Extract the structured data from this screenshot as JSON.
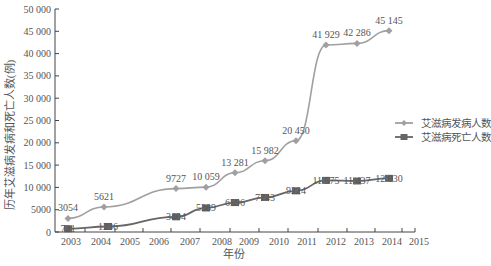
{
  "chart_data": {
    "type": "line",
    "title": "",
    "xlabel": "年份",
    "ylabel": "历年艾滋病发病和死亡人数(例)",
    "ylim": [
      0,
      50000
    ],
    "y_ticks": [
      "0",
      "5000",
      "10 000",
      "15 000",
      "20 000",
      "25 000",
      "30 000",
      "35 000",
      "40 000",
      "45 000",
      "50 000"
    ],
    "x_ticks": [
      "2003",
      "2004",
      "2005",
      "2006",
      "2007",
      "2008",
      "2009",
      "2010",
      "2011",
      "2012",
      "2013",
      "2014",
      "2015"
    ],
    "legend_position": "right",
    "grid": false,
    "series": [
      {
        "name": "艾滋病发病人数",
        "marker": "diamond",
        "color": "#a0a0a0",
        "x_px": [
          68,
          104,
          176,
          206,
          235,
          265,
          296,
          326,
          357,
          389
        ],
        "values": [
          3054,
          5621,
          9727,
          10059,
          13281,
          15982,
          20450,
          41929,
          42286,
          45145
        ],
        "labels": [
          "3054",
          "5621",
          "9727",
          "10 059",
          "13 281",
          "15 982",
          "20 450",
          "41 929",
          "42 286",
          "45 145"
        ]
      },
      {
        "name": "艾滋病死亡人数",
        "marker": "square",
        "color": "#666666",
        "x_px": [
          68,
          108,
          176,
          206,
          235,
          265,
          296,
          326,
          357,
          389
        ],
        "values": [
          721,
          1236,
          3404,
          5389,
          6596,
          7743,
          9224,
          11575,
          11437,
          12030
        ],
        "labels": [
          "721",
          "1236",
          "3404",
          "5389",
          "6596",
          "7743",
          "9224",
          "11 575",
          "11 437",
          "12 030"
        ]
      }
    ]
  }
}
